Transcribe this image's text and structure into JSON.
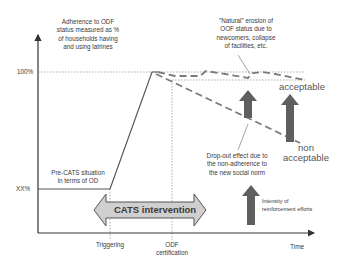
{
  "diagram": {
    "type": "conceptual line diagram",
    "y_axis": {
      "label_lines": [
        "Adherence to ODF",
        "status measured as %",
        "of households having",
        "and using latrines"
      ],
      "ticks": [
        "100%",
        "XX%"
      ]
    },
    "x_axis": {
      "label": "Time",
      "markers": [
        {
          "label_lines": [
            "Triggering"
          ]
        },
        {
          "label_lines": [
            "ODF",
            "certification"
          ]
        }
      ]
    },
    "annotations": {
      "pre_cats": [
        "Pre-CATS situation",
        "in terms of OD"
      ],
      "natural_erosion": [
        "\"Natural\" erosion of",
        "OOF status due to",
        "newcomers, collapse",
        "of facilities, etc."
      ],
      "dropout": [
        "Drop-out effect due to",
        "the non-adherence to",
        "the new social norm"
      ],
      "reinforcement": [
        "Intensity of",
        "reinforcement efforts"
      ],
      "acceptable": "acceptable",
      "non_acceptable": [
        "non",
        "acceptable"
      ]
    },
    "intervention_arrow": {
      "label": "CATS intervention"
    },
    "colors": {
      "line": "#555555",
      "arrow_fill": "#5f5f5f",
      "intervention_fill": "#cfcfcf",
      "dotted": "#9a9a9a"
    }
  }
}
